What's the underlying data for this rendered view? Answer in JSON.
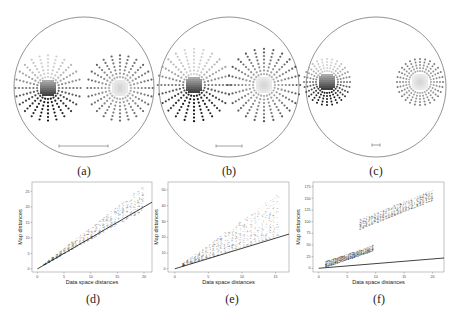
{
  "figure": {
    "maps": [
      {
        "id": "a",
        "caption": "(a)",
        "cx": 84,
        "cy": 87,
        "r": 70,
        "scale_bar": {
          "x1": 59,
          "x2": 108,
          "y": 146
        },
        "clusters": [
          {
            "cx": 48,
            "cy": 88,
            "rings": 7,
            "spacing": 3.6,
            "spokes": 24,
            "style": "top-light"
          },
          {
            "cx": 120,
            "cy": 88,
            "rings": 7,
            "spacing": 3.6,
            "spokes": 24,
            "style": "center-light"
          }
        ]
      },
      {
        "id": "b",
        "caption": "(b)",
        "cx": 229,
        "cy": 87,
        "r": 70,
        "scale_bar": {
          "x1": 216,
          "x2": 242,
          "y": 146
        },
        "clusters": [
          {
            "cx": 194,
            "cy": 85,
            "rings": 8,
            "spacing": 3.6,
            "spokes": 24,
            "style": "top-light"
          },
          {
            "cx": 264,
            "cy": 85,
            "rings": 8,
            "spacing": 3.6,
            "spokes": 24,
            "style": "center-light"
          }
        ]
      },
      {
        "id": "c",
        "caption": "(c)",
        "cx": 376,
        "cy": 87,
        "r": 70,
        "scale_bar": {
          "x1": 372,
          "x2": 380,
          "y": 145
        },
        "clusters": [
          {
            "cx": 327,
            "cy": 82,
            "rings": 5,
            "spacing": 3.0,
            "spokes": 28,
            "style": "top-light"
          },
          {
            "cx": 420,
            "cy": 82,
            "rings": 5,
            "spacing": 3.0,
            "spokes": 28,
            "style": "center-light"
          }
        ]
      }
    ],
    "scatter_captions": [
      "(d)",
      "(e)",
      "(f)"
    ]
  },
  "chart_data": [
    {
      "type": "scatter",
      "panel": "(d)",
      "title": "",
      "xlabel": "Data space distances",
      "ylabel": "Map distances",
      "xticks": [
        0,
        5,
        10,
        15,
        20
      ],
      "yticks": [
        0,
        5,
        10,
        15,
        20,
        25
      ],
      "xlim": [
        -1,
        21.5
      ],
      "ylim": [
        -1,
        28
      ],
      "reference_line": {
        "x": [
          0,
          21.5
        ],
        "y": [
          0,
          21.5
        ],
        "label": "y = x"
      },
      "point_cloud": {
        "x_range": [
          1,
          20
        ],
        "slope_low": 1.0,
        "slope_high": 1.35,
        "description": "Dense cloud of points lying slightly above identity line"
      },
      "grid": false
    },
    {
      "type": "scatter",
      "panel": "(e)",
      "title": "",
      "xlabel": "Data space distances",
      "ylabel": "Map distances",
      "xticks": [
        0,
        5,
        10,
        15
      ],
      "yticks": [
        0,
        10,
        20,
        30,
        40,
        50
      ],
      "xlim": [
        -1,
        17
      ],
      "ylim": [
        -2,
        55
      ],
      "reference_line": {
        "x": [
          0,
          17
        ],
        "y": [
          0,
          22
        ],
        "label": "identity"
      },
      "point_cloud": {
        "x_range": [
          1,
          15.5
        ],
        "slope_low": 1.4,
        "slope_high": 3.1,
        "description": "Dense cloud well above reference line, fanning outward"
      },
      "grid": false
    },
    {
      "type": "scatter",
      "panel": "(f)",
      "title": "",
      "xlabel": "Data space distances",
      "ylabel": "Map distances",
      "xticks": [
        0,
        5,
        10,
        15,
        20
      ],
      "yticks": [
        0,
        25,
        50,
        75,
        100,
        125,
        150,
        175
      ],
      "xlim": [
        -1,
        22
      ],
      "ylim": [
        -8,
        185
      ],
      "reference_line": {
        "x": [
          0,
          22
        ],
        "y": [
          0,
          22
        ],
        "label": "y = x"
      },
      "point_cloud": [
        {
          "x_range": [
            1,
            9.5
          ],
          "y_low_at_start": 3,
          "y_high_at_end": 50,
          "description": "Within-cluster distances"
        },
        {
          "x_range": [
            7,
            20
          ],
          "y_low_at_start": 85,
          "y_high_at_end": 170,
          "description": "Between-cluster distances"
        }
      ],
      "grid": false
    }
  ]
}
